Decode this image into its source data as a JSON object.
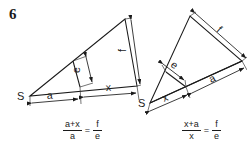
{
  "figure": {
    "number": "6",
    "left_diagram": {
      "vertex_label": "S",
      "segment_a": "a",
      "segment_x": "x",
      "height_e": "e",
      "height_f": "f",
      "formula": {
        "numerator": "a+x",
        "denominator": "a",
        "equals": "=",
        "rhs_numerator": "f",
        "rhs_denominator": "e"
      }
    },
    "right_diagram": {
      "vertex_label": "S",
      "segment_x": "x",
      "segment_a": "a",
      "height_e": "e",
      "height_f": "f",
      "formula": {
        "numerator": "x+a",
        "denominator": "x",
        "equals": "=",
        "rhs_numerator": "f",
        "rhs_denominator": "e"
      }
    }
  },
  "colors": {
    "ink": "#1a1a1a",
    "background": "#ffffff"
  }
}
